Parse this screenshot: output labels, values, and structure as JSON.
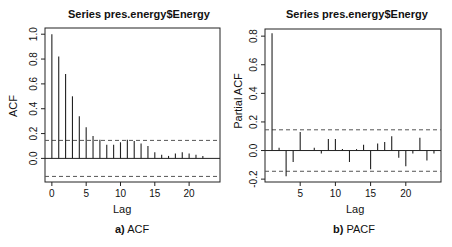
{
  "chart_data": [
    {
      "type": "bar",
      "subtype": "correlogram",
      "title": "Series pres.energy$Energy",
      "xlabel": "Lag",
      "ylabel": "ACF",
      "caption_prefix": "a)",
      "caption_text": " ACF",
      "x": [
        0,
        1,
        2,
        3,
        4,
        5,
        6,
        7,
        8,
        9,
        10,
        11,
        12,
        13,
        14,
        15,
        16,
        17,
        18,
        19,
        20,
        21,
        22
      ],
      "values": [
        1.0,
        0.82,
        0.68,
        0.5,
        0.34,
        0.25,
        0.18,
        0.15,
        0.11,
        0.11,
        0.13,
        0.15,
        0.14,
        0.12,
        0.1,
        0.05,
        0.03,
        0.02,
        0.04,
        0.05,
        0.04,
        0.03,
        0.02
      ],
      "confidence_bounds": [
        -0.145,
        0.145
      ],
      "xlim": [
        -1,
        24.5
      ],
      "ylim": [
        -0.19,
        1.05
      ],
      "xticks": [
        0,
        5,
        10,
        15,
        20
      ],
      "yticks": [
        0.0,
        0.2,
        0.4,
        0.6,
        0.8,
        1.0
      ],
      "ytick_labels": [
        "0.0",
        "0.2",
        "0.4",
        "0.6",
        "0.8",
        "1.0"
      ],
      "grid": false,
      "legend": null
    },
    {
      "type": "bar",
      "subtype": "correlogram",
      "title": "Series  pres.energy$Energy",
      "xlabel": "Lag",
      "ylabel": "Partial ACF",
      "caption_prefix": "b)",
      "caption_text": " PACF",
      "x": [
        1,
        2,
        3,
        4,
        5,
        6,
        7,
        8,
        9,
        10,
        11,
        12,
        13,
        14,
        15,
        16,
        17,
        18,
        19,
        20,
        21,
        22,
        23,
        24
      ],
      "values": [
        0.82,
        0.02,
        -0.18,
        -0.08,
        0.13,
        0.0,
        0.02,
        -0.02,
        0.08,
        0.08,
        0.01,
        -0.08,
        0.01,
        0.04,
        -0.13,
        0.05,
        0.06,
        0.1,
        -0.05,
        -0.11,
        -0.02,
        0.09,
        -0.07,
        -0.02
      ],
      "confidence_bounds": [
        -0.145,
        0.145
      ],
      "xlim": [
        0,
        25
      ],
      "ylim": [
        -0.22,
        0.85
      ],
      "xticks": [
        5,
        10,
        15,
        20
      ],
      "yticks": [
        -0.2,
        0.0,
        0.2,
        0.4,
        0.6,
        0.8
      ],
      "ytick_labels": [
        "-0.2",
        "0.0",
        "0.2",
        "0.4",
        "0.6",
        "0.8"
      ],
      "grid": false,
      "legend": null
    }
  ],
  "colors": {
    "bars": "#222222",
    "axes": "#222222",
    "bounds": "#555555",
    "background": "#ffffff"
  }
}
